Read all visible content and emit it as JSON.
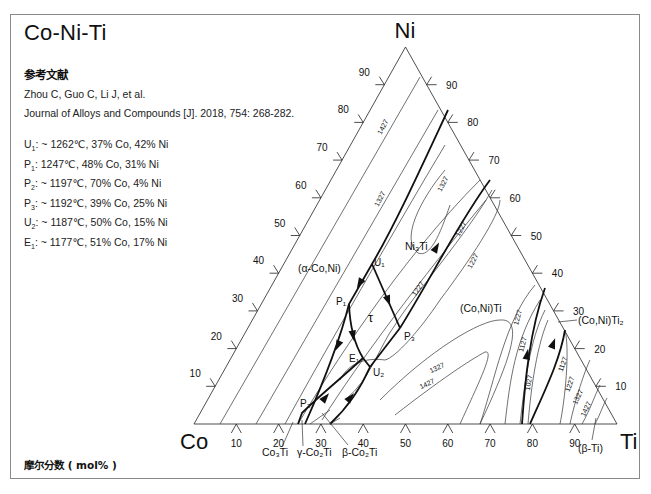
{
  "title": "Co-Ni-Ti",
  "reference": {
    "heading": "参考文献",
    "authors": "Zhou C, Guo C, Li J, et al.",
    "citation": "Journal of Alloys and Compounds [J]. 2018, 754: 268-282."
  },
  "invariant_points": [
    {
      "name": "U",
      "sub": "1",
      "text": ": ~ 1262℃, 37% Co, 42% Ni"
    },
    {
      "name": "P",
      "sub": "1",
      "text": ": 1247℃, 48% Co, 31% Ni"
    },
    {
      "name": "P",
      "sub": "2",
      "text": ": ~ 1197℃, 70% Co, 4% Ni"
    },
    {
      "name": "P",
      "sub": "3",
      "text": ": ~ 1192℃, 39% Co, 25% Ni"
    },
    {
      "name": "U",
      "sub": "2",
      "text": ": ~ 1187℃, 50% Co, 15% Ni"
    },
    {
      "name": "E",
      "sub": "1",
      "text": ": ~ 1177℃, 51% Co, 17% Ni"
    }
  ],
  "footer": "摩尔分数 ( mol% )",
  "corners": {
    "top": "Ni",
    "left": "Co",
    "right": "Ti"
  },
  "axis_ticks": {
    "left_edge": [
      "10",
      "20",
      "30",
      "40",
      "50",
      "60",
      "70",
      "80",
      "90"
    ],
    "right_edge": [
      "90",
      "80",
      "70",
      "60",
      "50",
      "40",
      "30",
      "20",
      "10"
    ],
    "bottom_edge": [
      "10",
      "20",
      "30",
      "40",
      "50",
      "60",
      "70",
      "80",
      "90"
    ]
  },
  "phase_labels": {
    "alpha_co_ni": "(α-Co,Ni)",
    "ni3ti": "Ni₃Ti",
    "tau": "τ",
    "co_ni_ti": "(Co,Ni)Ti",
    "co_ni_ti2": "(Co,Ni)Ti₂",
    "beta_ti": "(β-Ti)",
    "co3ti": "Co₃Ti",
    "gamma_co2ti": "γ-Co₂Ti",
    "beta_co2ti": "β-Co₂Ti"
  },
  "point_labels": {
    "U1": "U₁",
    "P1": "P₁",
    "P2": "P₂",
    "P3": "P₃",
    "U2": "U₂",
    "E1": "E₁"
  },
  "isotherm_labels": [
    "1427",
    "1327",
    "1327",
    "1227",
    "1227",
    "1227",
    "1127",
    "1027",
    "1127",
    "1227",
    "1327",
    "1427",
    "1327",
    "1427"
  ],
  "chart_data": {
    "type": "ternary-liquidus-projection",
    "title": "Co-Ni-Ti",
    "components": [
      "Co",
      "Ni",
      "Ti"
    ],
    "units": "mol%",
    "invariant_points": [
      {
        "label": "U1",
        "T_C": 1262,
        "Co": 37,
        "Ni": 42
      },
      {
        "label": "P1",
        "T_C": 1247,
        "Co": 48,
        "Ni": 31
      },
      {
        "label": "P2",
        "T_C": 1197,
        "Co": 70,
        "Ni": 4
      },
      {
        "label": "P3",
        "T_C": 1192,
        "Co": 39,
        "Ni": 25
      },
      {
        "label": "U2",
        "T_C": 1187,
        "Co": 50,
        "Ni": 15
      },
      {
        "label": "E1",
        "T_C": 1177,
        "Co": 51,
        "Ni": 17
      }
    ],
    "isotherms_C": [
      1027,
      1127,
      1227,
      1327,
      1427
    ],
    "primary_phases": [
      "(α-Co,Ni)",
      "Ni3Ti",
      "τ",
      "(Co,Ni)Ti",
      "(Co,Ni)Ti2",
      "(β-Ti)",
      "Co3Ti",
      "γ-Co2Ti",
      "β-Co2Ti"
    ],
    "tick_step": 10
  }
}
